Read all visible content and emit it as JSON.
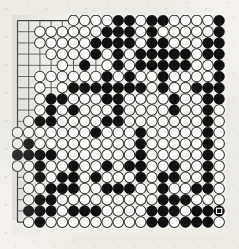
{
  "board": {
    "title": "Go board position",
    "game": "Go (Weiqi/Baduk)",
    "size": 19,
    "columns": [
      "A",
      "B",
      "C",
      "D",
      "E",
      "F",
      "G",
      "H",
      "J",
      "K",
      "L",
      "M",
      "N",
      "O",
      "P",
      "Q",
      "R",
      "S",
      "T"
    ],
    "rows": [
      19,
      18,
      17,
      16,
      15,
      14,
      13,
      12,
      11,
      10,
      9,
      8,
      7,
      6,
      5,
      4,
      3,
      2,
      1
    ],
    "colors": {
      "black_stone": "#111111",
      "white_stone": "#fbfbf9",
      "white_stone_outline": "#3a3a3a",
      "grid_line": "#4a4a48",
      "board_background": "#efede8",
      "page_background": "#f4f2ee"
    },
    "star_points": [
      [
        3,
        3
      ],
      [
        9,
        3
      ],
      [
        15,
        3
      ],
      [
        3,
        9
      ],
      [
        9,
        9
      ],
      [
        15,
        9
      ],
      [
        3,
        15
      ],
      [
        9,
        15
      ],
      [
        15,
        15
      ]
    ],
    "last_move_marker": {
      "col": 18,
      "row": 17,
      "shape": "square"
    },
    "legend": {
      "b": "black stone",
      "w": "white stone",
      ".": "empty point"
    },
    "grid": [
      ".....wwwwbbwbbwwwwb",
      "..wwwwwwbbbwbwwwwwb",
      "..wwwwwbbbbwbbwwwbb",
      "...wwwwbwbwbbbbbwbb",
      "....w.b.wbwbbbbbwwb",
      "..wwwwwwbwbwwbwwwwb",
      "..w.wbbbbbbbwbwwbbb",
      "..wbbwwwbbwwwwbwwbb",
      "..wbwbwwwbwwwwbwwbw",
      ".wbbwwwwbbwwwwwwwbw",
      "wwwwwwwbwwwbwwwwwbw",
      "wbwwwwwwwwwbwwwwwbw",
      "bbbbwwwwwwwbwwwwwbw",
      "wwbwwbwwbwbbwwbwwbw",
      ".wbwbbwbwwwbwbbwwbw",
      ".wwbbbwwbbbwwbwwbbw",
      ".wbbwwwwwwwwwbbbwww",
      ".bbbwbbbwwwwbbbwbbb",
      ".wbwwwwwwwwwbbwbbbw"
    ]
  }
}
